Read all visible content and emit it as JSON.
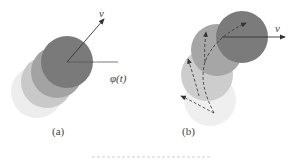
{
  "panel_a": {
    "label": "(a)",
    "velocity_label": "v",
    "angle_label": "φ(t)",
    "circles": [
      {
        "cx": 37,
        "cy": 92,
        "r": 26,
        "fill": "#ededed"
      },
      {
        "cx": 47,
        "cy": 82,
        "r": 26,
        "fill": "#c9c9c9"
      },
      {
        "cx": 57,
        "cy": 72,
        "r": 26,
        "fill": "#a3a3a3"
      },
      {
        "cx": 67,
        "cy": 62,
        "r": 26,
        "fill": "#7a7a7a"
      }
    ]
  },
  "panel_b": {
    "label": "(b)",
    "velocity_label": "v",
    "circles": [
      {
        "cx": 210,
        "cy": 100,
        "r": 26,
        "fill": "#efefef"
      },
      {
        "cx": 207,
        "cy": 75,
        "r": 26,
        "fill": "#cdcdcd"
      },
      {
        "cx": 217,
        "cy": 50,
        "r": 26,
        "fill": "#a6a6a6"
      },
      {
        "cx": 242,
        "cy": 37,
        "r": 26,
        "fill": "#7b7b7b"
      }
    ]
  },
  "colors": {
    "arrow": "#333333",
    "reference_line": "#555555",
    "text": "#444444"
  }
}
